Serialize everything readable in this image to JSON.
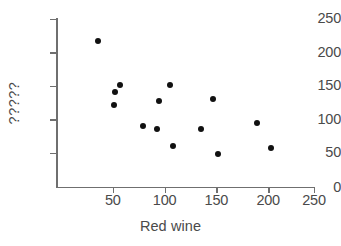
{
  "chart_data": {
    "type": "scatter",
    "title": "",
    "xlabel": "Red wine",
    "ylabel": "?????",
    "xlim": [
      0,
      260
    ],
    "ylim": [
      0,
      255
    ],
    "xticks": [
      50,
      100,
      150,
      200,
      250
    ],
    "yticks": [
      0,
      50,
      100,
      150,
      200,
      250
    ],
    "xtick_labels": [
      "50",
      "100",
      "150",
      "200",
      "250"
    ],
    "ytick_labels": [
      "0",
      "50",
      "100",
      "150",
      "200",
      "250"
    ],
    "grid": false,
    "legend": false,
    "marker": "filled-circle",
    "marker_color": "#111111",
    "axis_color": "#6f6f6f",
    "text_color": "#4a4a4a",
    "points": [
      {
        "x": 37,
        "y": 217
      },
      {
        "x": 52,
        "y": 122
      },
      {
        "x": 53,
        "y": 141
      },
      {
        "x": 58,
        "y": 151
      },
      {
        "x": 81,
        "y": 90
      },
      {
        "x": 95,
        "y": 86
      },
      {
        "x": 97,
        "y": 127
      },
      {
        "x": 108,
        "y": 151
      },
      {
        "x": 111,
        "y": 60
      },
      {
        "x": 138,
        "y": 86
      },
      {
        "x": 150,
        "y": 130
      },
      {
        "x": 155,
        "y": 48
      },
      {
        "x": 194,
        "y": 95
      },
      {
        "x": 208,
        "y": 58
      }
    ]
  }
}
